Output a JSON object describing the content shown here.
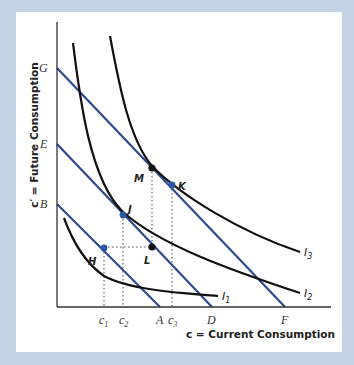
{
  "diagram": {
    "title": "",
    "axes": {
      "x_label": "c = Current Consumption",
      "y_label": "c′ = Future Consumption"
    },
    "colors": {
      "budget_line": "#2b4a8f",
      "indifference_curve": "#111111",
      "point_blue": "#2e56a6",
      "point_black": "#111111",
      "guide": "#444444"
    },
    "y_intercepts": [
      {
        "id": "B",
        "label": "B"
      },
      {
        "id": "E",
        "label": "E"
      },
      {
        "id": "G",
        "label": "G"
      }
    ],
    "x_ticks": [
      {
        "id": "c1",
        "label": "c",
        "sub": "1"
      },
      {
        "id": "c2",
        "label": "c",
        "sub": "2"
      },
      {
        "id": "A",
        "label": "A",
        "sub": ""
      },
      {
        "id": "c3",
        "label": "c",
        "sub": "3"
      },
      {
        "id": "D",
        "label": "D",
        "sub": ""
      },
      {
        "id": "F",
        "label": "F",
        "sub": ""
      }
    ],
    "budget_lines": [
      {
        "name": "budget-line-BA",
        "from": "B",
        "to": "A"
      },
      {
        "name": "budget-line-ED",
        "from": "E",
        "to": "D"
      },
      {
        "name": "budget-line-GF",
        "from": "G",
        "to": "F"
      }
    ],
    "indifference_curves": [
      {
        "id": "I1",
        "label": "I",
        "sub": "1"
      },
      {
        "id": "I2",
        "label": "I",
        "sub": "2"
      },
      {
        "id": "I3",
        "label": "I",
        "sub": "3"
      }
    ],
    "points": [
      {
        "id": "H",
        "label": "H",
        "style": "blue"
      },
      {
        "id": "J",
        "label": "J",
        "style": "blue"
      },
      {
        "id": "K",
        "label": "K",
        "style": "blue"
      },
      {
        "id": "L",
        "label": "L",
        "style": "black"
      },
      {
        "id": "M",
        "label": "M",
        "style": "black"
      }
    ]
  }
}
